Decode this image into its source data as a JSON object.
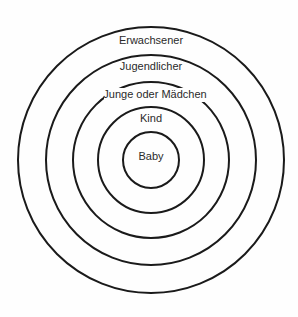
{
  "diagram": {
    "type": "concentric-circles",
    "center": [
      151,
      160
    ],
    "rings": [
      {
        "label": "Erwachsener",
        "radius": 133,
        "label_y": 41
      },
      {
        "label": "Jugendlicher",
        "radius": 105,
        "label_y": 67
      },
      {
        "label": "Junge oder Mädchen",
        "radius": 78,
        "label_y": 95
      },
      {
        "label": "Kind",
        "radius": 53,
        "label_y": 119
      },
      {
        "label": "Baby",
        "radius": 28,
        "label_y": 157
      }
    ],
    "stroke_color": "#1a1a1a",
    "text_color": "#2a2a2a"
  }
}
